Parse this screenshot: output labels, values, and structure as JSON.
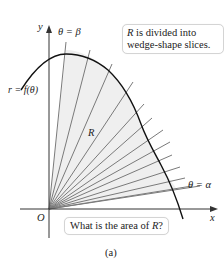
{
  "figure": {
    "caption": "(a)",
    "axes": {
      "x_label": "x",
      "y_label": "y",
      "origin_label": "O"
    },
    "curve_label": "r = f(θ)",
    "region_label": "R",
    "ray_labels": {
      "upper": "θ = β",
      "lower": "θ = α"
    },
    "notes": {
      "top": {
        "line1_var": "R",
        "line1_rest": " is divided into",
        "line2": "wedge-shape slices."
      },
      "bottom": {
        "prefix": "What is the area of ",
        "var": "R",
        "suffix": "?"
      }
    },
    "colors": {
      "region_fill": "#efefef",
      "ray_color": "#7a7a7a",
      "curve_color": "#111111",
      "axis_color": "#333333",
      "note_border": "#d4d4d4"
    },
    "ray_count": 13
  }
}
